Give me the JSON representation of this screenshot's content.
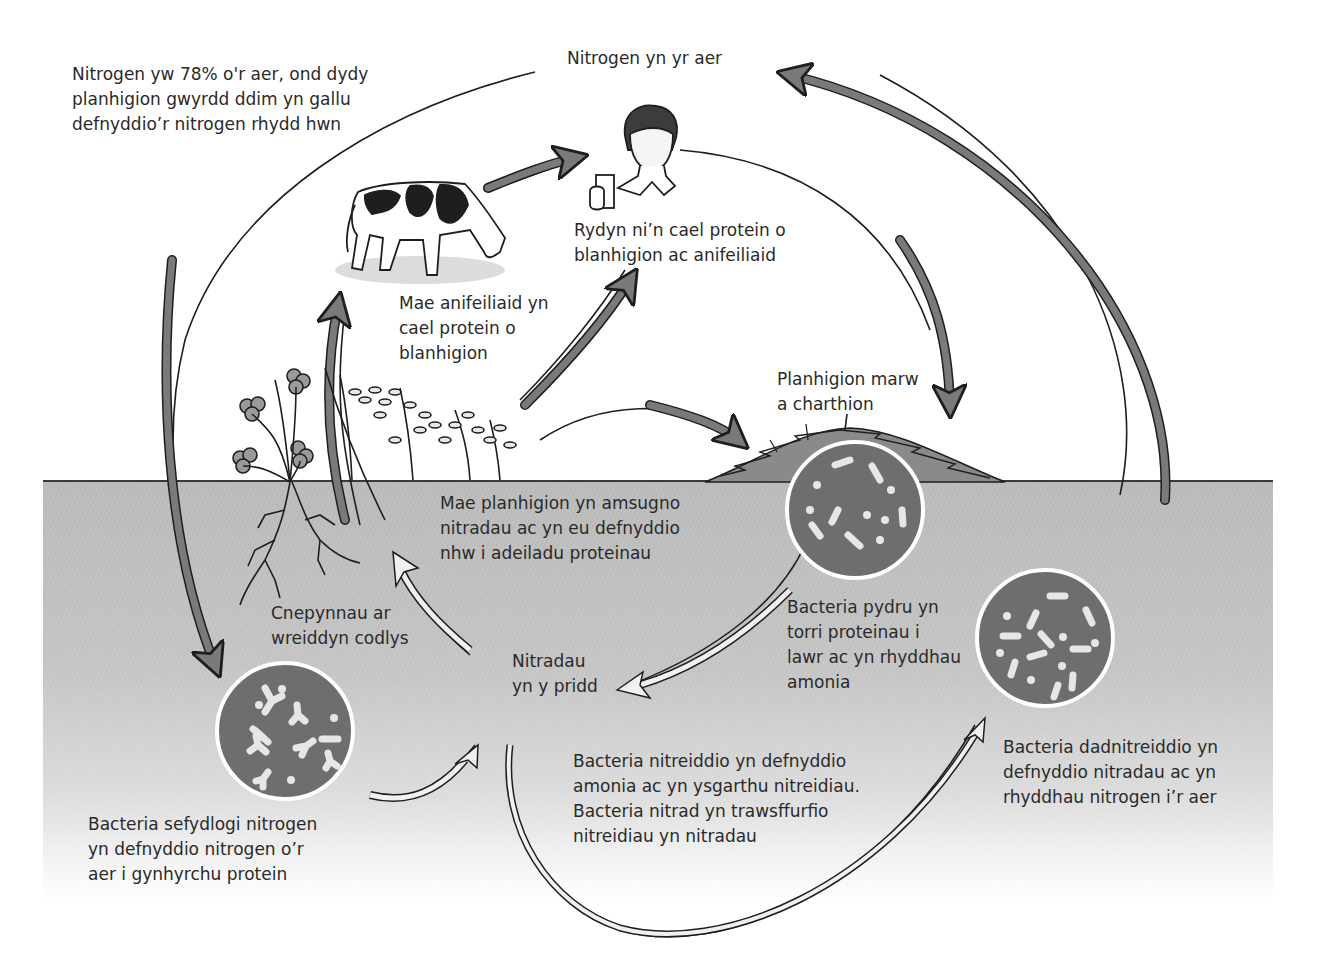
{
  "diagram": {
    "colors": {
      "soil": "#c0c0c0",
      "ground_line": "#3a3a3a",
      "arrow_fill_dark": "#7a7a7a",
      "arrow_outline": "#1e1e1e",
      "bacteria_disc": "#6e6e6e",
      "bacteria_cells": "#e6e6e6",
      "hollow_arrow_fill": "#f0f0f0"
    },
    "labels": {
      "air_fact": "Nitrogen yw 78% o'r aer, ond dydy\nplanhigion gwyrdd ddim yn gallu\ndefnyddio’r nitrogen rhydd hwn",
      "nitrogen_in_air": "Nitrogen yn yr aer",
      "humans_protein": "Rydyn ni’n cael protein o\nblanhigion ac anifeiliaid",
      "animals_protein": "Mae anifeiliaid yn\ncael protein o\nblanhigion",
      "dead_plants": "Planhigion marw\na charthion",
      "plants_absorb": "Mae planhigion yn amsugno\nnitradau ac yn eu defnyddio\nnhw i adeiladu proteinau",
      "root_nodules": "Cnepynnau ar\nwreiddyn codlys",
      "nitrates_in_soil": "Nitradau\nyn y pridd",
      "decomposers": "Bacteria pydru yn\ntorri proteinau i\nlawr ac yn rhyddhau\namonia",
      "denitrifying": "Bacteria dadnitreiddio yn\ndefnyddio nitradau ac yn\nrhyddhau nitrogen i’r aer",
      "nitrifying": "Bacteria nitreiddio yn defnyddio\namonia ac yn ysgarthu nitreidiau.\nBacteria nitrad yn trawsffurfio\nnitreidiau yn nitradau",
      "nitrogen_fixing": "Bacteria sefydlogi nitrogen\nyn defnyddio nitrogen o’r\naer i gynhyrchu protein"
    },
    "nodes": [
      {
        "id": "air",
        "label_key": "nitrogen_in_air"
      },
      {
        "id": "human",
        "label_key": "humans_protein",
        "icon": "person-holding-glass"
      },
      {
        "id": "cow",
        "label_key": "animals_protein",
        "icon": "grazing-cow"
      },
      {
        "id": "plants",
        "label_key": "plants_absorb",
        "icon": "clover-and-cereal-plants"
      },
      {
        "id": "dead-matter",
        "label_key": "dead_plants",
        "icon": "decaying-mound"
      },
      {
        "id": "decomposer-bacteria",
        "label_key": "decomposers",
        "icon": "bacteria-disc"
      },
      {
        "id": "soil-nitrates",
        "label_key": "nitrates_in_soil"
      },
      {
        "id": "nitrifying-bacteria",
        "label_key": "nitrifying"
      },
      {
        "id": "denitrifying-bacteria",
        "label_key": "denitrifying",
        "icon": "bacteria-disc"
      },
      {
        "id": "fixing-bacteria",
        "label_key": "nitrogen_fixing",
        "icon": "bacteria-disc"
      },
      {
        "id": "root-nodules",
        "label_key": "root_nodules"
      }
    ],
    "edges": [
      {
        "from": "air",
        "to": "fixing-bacteria",
        "style": "dark-arrow"
      },
      {
        "from": "cow",
        "to": "human",
        "style": "dark-arrow"
      },
      {
        "from": "plants",
        "to": "human",
        "style": "dark-arrow"
      },
      {
        "from": "root-nodules",
        "to": "cow",
        "style": "dark-arrow"
      },
      {
        "from": "human",
        "to": "dead-matter",
        "style": "dark-arrow"
      },
      {
        "from": "plants",
        "to": "dead-matter",
        "style": "dark-arrow"
      },
      {
        "from": "denitrifying-bacteria",
        "to": "air",
        "style": "dark-arrow"
      },
      {
        "from": "decomposer-bacteria",
        "to": "soil-nitrates",
        "style": "hollow-arrow"
      },
      {
        "from": "soil-nitrates",
        "to": "plants",
        "style": "hollow-arrow"
      },
      {
        "from": "fixing-bacteria",
        "to": "soil-nitrates",
        "style": "hollow-arrow"
      },
      {
        "from": "soil-nitrates",
        "to": "denitrifying-bacteria",
        "style": "hollow-arrow"
      }
    ]
  }
}
